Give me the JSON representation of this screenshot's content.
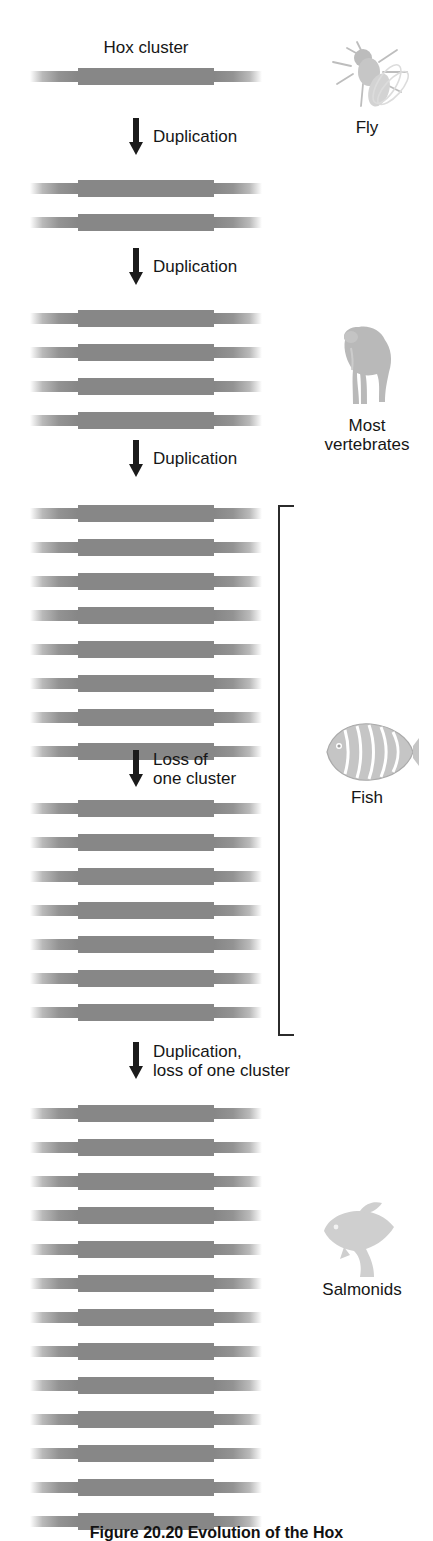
{
  "figure": {
    "title": "Hox cluster",
    "caption": "Figure 20.20  Evolution of the Hox"
  },
  "stages": [
    {
      "id": "fly-stage",
      "cluster_count": 1,
      "top": 68,
      "organism": {
        "name": "Fly",
        "art": "fly-silhouette"
      }
    },
    {
      "id": "two-cluster-stage",
      "cluster_count": 2,
      "top": 180,
      "organism": null
    },
    {
      "id": "vertebrate-stage",
      "cluster_count": 4,
      "top": 310,
      "organism": {
        "name": "Most\nvertebrates",
        "art": "monkey-silhouette"
      }
    },
    {
      "id": "eight-cluster-stage",
      "cluster_count": 8,
      "top": 505,
      "organism": null
    },
    {
      "id": "seven-cluster-stage",
      "cluster_count": 7,
      "top": 800,
      "organism": null
    },
    {
      "id": "salmonid-stage",
      "cluster_count": 13,
      "top": 1105,
      "organism": {
        "name": "Salmonids",
        "art": "salmon-silhouette"
      }
    }
  ],
  "transitions": [
    {
      "id": "transition-1",
      "label": "Duplication",
      "top": 118,
      "left": 128
    },
    {
      "id": "transition-2",
      "label": "Duplication",
      "top": 248,
      "left": 128
    },
    {
      "id": "transition-3",
      "label": "Duplication",
      "top": 440,
      "left": 128
    },
    {
      "id": "transition-4",
      "label": "Loss of\none cluster",
      "top": 750,
      "left": 128
    },
    {
      "id": "transition-5",
      "label": "Duplication,\nloss of one cluster",
      "top": 1042,
      "left": 128
    }
  ],
  "bracket": {
    "label": "fish-grouping-bracket",
    "top": 505,
    "bottom": 1032,
    "left": 278,
    "width": 14
  },
  "organism_side_labels": [
    {
      "name": "Fly",
      "top": 32,
      "left": 305,
      "art_height": 86,
      "label_top": 126
    },
    {
      "name": "Most\nvertebrates",
      "top": 318,
      "left": 305,
      "art_height": 98,
      "label_top": 398
    },
    {
      "name": "Fish",
      "top": 712,
      "left": 305,
      "art_height": 76,
      "label_top": 788
    },
    {
      "name": "Salmonids",
      "top": 1185,
      "left": 300,
      "art_height": 95,
      "label_top": 1234
    }
  ],
  "colors": {
    "cluster_core": "#878787",
    "cluster_arm": "#808080",
    "text": "#161616",
    "arrow": "#1b1b1b",
    "bracket": "#2b2b2b",
    "background": "#ffffff",
    "organism_art": "#c9c9c9"
  },
  "geometry": {
    "bar_left": 30,
    "bar_width": 232,
    "bar_pitch": 34,
    "bar_height": 17
  }
}
